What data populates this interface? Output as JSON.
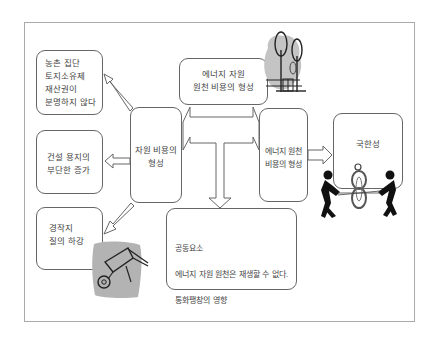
{
  "diagram": {
    "boxes": {
      "rural_collective": {
        "text": "농촌 집단\n토지소유제\n재산권이\n분명하지 않다"
      },
      "construction_land": {
        "text": "건설 용지의\n부단한 증가"
      },
      "farmland_quality": {
        "text": "경작지\n질의 하강"
      },
      "resource_cost": {
        "text": "자원 비용의\n형성"
      },
      "energy_resource_source_cost": {
        "text": "에너지 자원\n원천 비용의 형성"
      },
      "energy_source_cost": {
        "text": "에너지 원천\n비용의 형성"
      },
      "limitation": {
        "text": "국한성"
      },
      "common_factors": {
        "title": "공동요소",
        "line1": "에너지 자원 원천은 재생할 수 없다.",
        "line2": "통화팽창의 영향"
      }
    },
    "icons": [
      "trees-house-icon",
      "wheelbarrow-icon",
      "tug-of-war-icon"
    ],
    "colors": {
      "border": "#666666",
      "frame": "#aaaaaa",
      "clipart_bg": "#bdbdbd"
    }
  }
}
